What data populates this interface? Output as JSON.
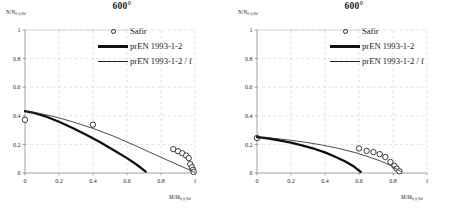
{
  "figure": {
    "panels": [
      {
        "name": "left-panel",
        "title": "600°",
        "ylabel_main": "N/N",
        "ylabel_sub": "fi,θ,Rd",
        "xlabel_main": "M/M",
        "xlabel_sub": "fi,θ,Rd",
        "legend": [
          {
            "label": "Safir",
            "key": "marker-circle"
          },
          {
            "label": "prEN 1993-1-2",
            "key": "line-thick"
          },
          {
            "label": "prEN 1993-1-2 / f",
            "key": "line-thin"
          }
        ],
        "chart_data": {
          "type": "scatter",
          "title": "600°",
          "xlabel": "M/M fi,θ,Rd",
          "ylabel": "N/N fi,θ,Rd",
          "xlim": [
            0,
            1
          ],
          "ylim": [
            0,
            1
          ],
          "xticks": [
            0,
            0.2,
            0.4,
            0.6,
            0.8,
            1
          ],
          "xticklabels": [
            "0",
            "0.2",
            "0.4",
            "0.6",
            "0.8",
            "1"
          ],
          "yticks": [
            0,
            0.2,
            0.4,
            0.6,
            0.8,
            1
          ],
          "yticklabels": [
            "0",
            "0.2",
            "0.4",
            "0.6",
            "0.8",
            "1"
          ],
          "grid": true,
          "grid_style": "dashed",
          "legend_position": "upper-right-outside",
          "series": [
            {
              "name": "Safir",
              "type": "scatter",
              "marker": "open-circle",
              "points": [
                [
                  0.0,
                  0.372
                ],
                [
                  0.4,
                  0.338
                ],
                [
                  0.872,
                  0.167
                ],
                [
                  0.9,
                  0.152
                ],
                [
                  0.925,
                  0.138
                ],
                [
                  0.948,
                  0.122
                ],
                [
                  0.963,
                  0.104
                ],
                [
                  0.972,
                  0.062
                ],
                [
                  0.982,
                  0.04
                ],
                [
                  0.988,
                  0.022
                ],
                [
                  0.992,
                  0.008
                ]
              ]
            },
            {
              "name": "prEN 1993-1-2",
              "type": "line",
              "linewidth": "thick",
              "points": [
                [
                  0.0,
                  0.432
                ],
                [
                  0.06,
                  0.418
                ],
                [
                  0.13,
                  0.392
                ],
                [
                  0.2,
                  0.358
                ],
                [
                  0.28,
                  0.315
                ],
                [
                  0.36,
                  0.268
                ],
                [
                  0.44,
                  0.216
                ],
                [
                  0.52,
                  0.161
                ],
                [
                  0.6,
                  0.104
                ],
                [
                  0.66,
                  0.056
                ],
                [
                  0.71,
                  0.01
                ]
              ]
            },
            {
              "name": "prEN 1993-1-2 / f",
              "type": "line",
              "linewidth": "thin",
              "points": [
                [
                  0.0,
                  0.432
                ],
                [
                  0.08,
                  0.418
                ],
                [
                  0.18,
                  0.392
                ],
                [
                  0.28,
                  0.358
                ],
                [
                  0.4,
                  0.312
                ],
                [
                  0.52,
                  0.258
                ],
                [
                  0.64,
                  0.196
                ],
                [
                  0.76,
                  0.131
                ],
                [
                  0.86,
                  0.078
                ],
                [
                  0.94,
                  0.036
                ],
                [
                  1.0,
                  0.004
                ]
              ]
            }
          ]
        }
      },
      {
        "name": "right-panel",
        "title": "600°",
        "ylabel_main": "N/N",
        "ylabel_sub": "fi,θ,Rd",
        "xlabel_main": "M/M",
        "xlabel_sub": "fi,θ,Rd",
        "legend": [
          {
            "label": "Safir",
            "key": "marker-circle"
          },
          {
            "label": "prEN 1993-1-2",
            "key": "line-thick"
          },
          {
            "label": "prEN 1993-1-2 / f",
            "key": "line-thin"
          }
        ],
        "chart_data": {
          "type": "scatter",
          "title": "600°",
          "xlabel": "M/M fi,θ,Rd",
          "ylabel": "N/N fi,θ,Rd",
          "xlim": [
            0,
            1
          ],
          "ylim": [
            0,
            1
          ],
          "xticks": [
            0,
            0.2,
            0.4,
            0.6,
            0.8,
            1
          ],
          "xticklabels": [
            "0",
            "0.2",
            "0.4",
            "0.6",
            "0.8",
            "1"
          ],
          "yticks": [
            0,
            0.2,
            0.4,
            0.6,
            0.8,
            1
          ],
          "yticklabels": [
            "0",
            "0.2",
            "0.4",
            "0.6",
            "0.8",
            "1"
          ],
          "grid": true,
          "grid_style": "dashed",
          "legend_position": "upper-right-outside",
          "series": [
            {
              "name": "Safir",
              "type": "scatter",
              "marker": "open-circle",
              "points": [
                [
                  0.0,
                  0.245
                ],
                [
                  0.6,
                  0.172
                ],
                [
                  0.645,
                  0.155
                ],
                [
                  0.685,
                  0.146
                ],
                [
                  0.722,
                  0.132
                ],
                [
                  0.755,
                  0.112
                ],
                [
                  0.785,
                  0.077
                ],
                [
                  0.808,
                  0.05
                ],
                [
                  0.822,
                  0.03
                ],
                [
                  0.838,
                  0.012
                ]
              ]
            },
            {
              "name": "prEN 1993-1-2",
              "type": "line",
              "linewidth": "thick",
              "points": [
                [
                  0.0,
                  0.251
                ],
                [
                  0.06,
                  0.243
                ],
                [
                  0.13,
                  0.229
                ],
                [
                  0.2,
                  0.212
                ],
                [
                  0.27,
                  0.192
                ],
                [
                  0.34,
                  0.168
                ],
                [
                  0.4,
                  0.144
                ],
                [
                  0.46,
                  0.114
                ],
                [
                  0.52,
                  0.08
                ],
                [
                  0.57,
                  0.045
                ],
                [
                  0.61,
                  0.008
                ]
              ]
            },
            {
              "name": "prEN 1993-1-2 / f",
              "type": "line",
              "linewidth": "thin",
              "points": [
                [
                  0.0,
                  0.251
                ],
                [
                  0.08,
                  0.244
                ],
                [
                  0.18,
                  0.232
                ],
                [
                  0.28,
                  0.216
                ],
                [
                  0.38,
                  0.196
                ],
                [
                  0.48,
                  0.172
                ],
                [
                  0.58,
                  0.142
                ],
                [
                  0.66,
                  0.112
                ],
                [
                  0.73,
                  0.082
                ],
                [
                  0.79,
                  0.05
                ],
                [
                  0.85,
                  0.008
                ]
              ]
            }
          ]
        }
      }
    ]
  }
}
